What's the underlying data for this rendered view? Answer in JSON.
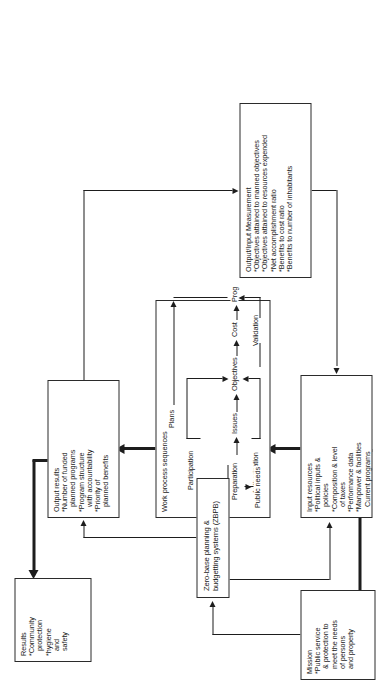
{
  "figure": {
    "orientation": "rotated-90-landscape",
    "boxes": {
      "results": {
        "title": "Results",
        "items": [
          "*Community",
          "protection",
          "*hygiene",
          "and",
          "safety"
        ]
      },
      "output_results": {
        "title": "Output results",
        "items": [
          "*Number of funded",
          "planned programs",
          "*Program structure",
          "with accountability",
          "*Priority of",
          "planned benefits"
        ]
      },
      "work_process": {
        "title": "Work process sequences",
        "nodes": {
          "preparation": "Preparation",
          "issues": "Issues",
          "objectives": "Objectives",
          "cost": "Cost",
          "prog": "Prog",
          "participation": "Participation",
          "plans": "Plans",
          "authorization": "Authorization",
          "validation": "Validation",
          "public_needs": "Public needs"
        }
      },
      "input_resources": {
        "title": "Input resources",
        "items": [
          "*Political inputs &",
          "policies",
          "*Composition & level",
          "of taxes",
          "*Performance data",
          "*Manpower & facilities",
          "Current  programs"
        ]
      },
      "mission": {
        "title": "Mission",
        "items": [
          "*Public service",
          "& protection to",
          "meet the needs",
          "of persons",
          "and property"
        ]
      },
      "zbpb": {
        "title": "Zero-base planning &",
        "title2": "budgetting systems (ZBPB)"
      },
      "measurement": {
        "title": "Output/Input Measurement",
        "items": [
          "*Objectives attained to manned objectives",
          "*Objectives attained to resources expended",
          "*Net accomplishment ratio",
          "*Benefits to cost ratio",
          "*Benefits to number of inhabitants"
        ]
      }
    },
    "colors": {
      "ink": "#1d1d1d",
      "box_border": "#2b2b2b",
      "background": "#ffffff"
    }
  }
}
